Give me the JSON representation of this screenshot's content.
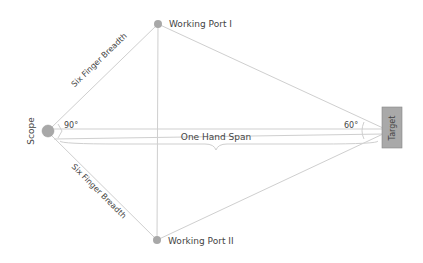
{
  "diagram": {
    "nodes": {
      "scope": {
        "label": "Scope",
        "x": 48,
        "y": 131
      },
      "port1": {
        "label": "Working Port I",
        "x": 158,
        "y": 24
      },
      "port2": {
        "label": "Working Port II",
        "x": 157,
        "y": 240
      },
      "target": {
        "label": "Target",
        "x": 383,
        "y": 131
      }
    },
    "edges": {
      "scope_port1": {
        "label": "Six Finger Breadth"
      },
      "scope_port2": {
        "label": "Six Finger Breadth"
      },
      "scope_target": {
        "label": "One Hand Span"
      }
    },
    "angles": {
      "scope_angle": "90°",
      "target_angle": "60°"
    },
    "colors": {
      "line": "#c8c8c8",
      "node_fill": "#a8a8a8",
      "target_fill": "#a9a9a9",
      "text": "#444444"
    }
  }
}
